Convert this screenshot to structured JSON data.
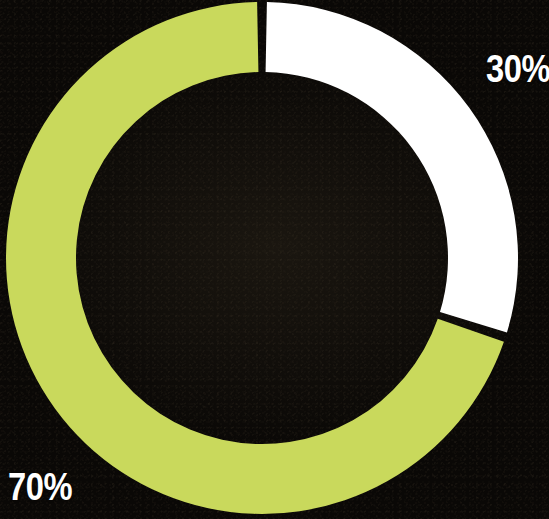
{
  "chart_data": {
    "type": "pie",
    "variant": "donut",
    "title": "",
    "subtitle": "",
    "xlabel": "",
    "ylabel": "",
    "grid": false,
    "legend": "none",
    "categories": [
      "70%",
      "30%"
    ],
    "values": [
      70,
      30
    ],
    "unit": "percent",
    "total": 100,
    "start_angle_deg": 0,
    "direction": "counter-clockwise",
    "slices": [
      {
        "label": "70%",
        "value": 70,
        "color": "#c9d95c",
        "sweep_deg": 252,
        "start_deg": 108,
        "end_deg": 360,
        "label_position": "bottom-left"
      },
      {
        "label": "30%",
        "value": 30,
        "color": "#ffffff",
        "sweep_deg": 108,
        "start_deg": 0,
        "end_deg": 108,
        "label_position": "top-right"
      }
    ],
    "annotations": [
      {
        "text": "30%",
        "x": 516,
        "y": 69,
        "color": "#ffffff"
      },
      {
        "text": "70%",
        "x": 38,
        "y": 487,
        "color": "#ffffff"
      }
    ]
  },
  "geometry": {
    "center_x": 262,
    "center_y": 258,
    "outer_radius": 256,
    "inner_radius": 186,
    "gap_deg": 2.2
  },
  "colors": {
    "background": "#0a0806",
    "accent_green": "#c9d95c",
    "accent_white": "#ffffff",
    "label_text": "#ffffff",
    "separator": "#0a0806"
  },
  "labels": {
    "slice_30": "30%",
    "slice_70": "70%"
  }
}
